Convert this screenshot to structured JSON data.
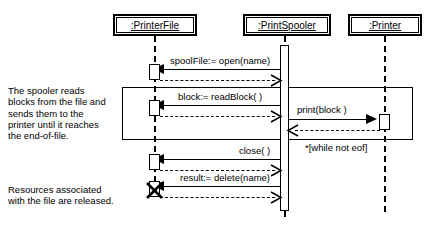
{
  "diagram": {
    "type": "uml-sequence-diagram",
    "objects": [
      {
        "id": "printerfile",
        "label": ":PrinterFile",
        "lifeline_x": 155
      },
      {
        "id": "printspooler",
        "label": ":PrintSpooler",
        "lifeline_x": 285
      },
      {
        "id": "printer",
        "label": ":Printer",
        "lifeline_x": 385
      }
    ],
    "messages": [
      {
        "id": "m1",
        "label": "spoolFile:= open(name)",
        "from": "printspooler",
        "to": "printerfile",
        "kind": "call",
        "direction": "left"
      },
      {
        "id": "r1",
        "label": "",
        "from": "printerfile",
        "to": "printspooler",
        "kind": "return",
        "direction": "right"
      },
      {
        "id": "m2",
        "label": "block:= readBlock( )",
        "from": "printspooler",
        "to": "printerfile",
        "kind": "call",
        "direction": "left"
      },
      {
        "id": "r2",
        "label": "",
        "from": "printerfile",
        "to": "printspooler",
        "kind": "return",
        "direction": "right"
      },
      {
        "id": "m3",
        "label": "print(block )",
        "from": "printspooler",
        "to": "printer",
        "kind": "call",
        "direction": "right"
      },
      {
        "id": "r3",
        "label": "",
        "from": "printer",
        "to": "printspooler",
        "kind": "return",
        "direction": "left"
      },
      {
        "id": "m4",
        "label": "close( )",
        "from": "printspooler",
        "to": "printerfile",
        "kind": "call",
        "direction": "left"
      },
      {
        "id": "r4",
        "label": "",
        "from": "printerfile",
        "to": "printspooler",
        "kind": "return",
        "direction": "right"
      },
      {
        "id": "m5",
        "label": "result:= delete(name)",
        "from": "printspooler",
        "to": "printerfile",
        "kind": "call",
        "direction": "left"
      },
      {
        "id": "r5",
        "label": "",
        "from": "printerfile",
        "to": "printspooler",
        "kind": "return",
        "direction": "right"
      }
    ],
    "loop": {
      "guard": "*[while not eof]",
      "encloses": [
        "m2",
        "r2",
        "m3",
        "r3"
      ]
    },
    "notes": [
      {
        "id": "note-loop",
        "text": "The spooler reads\nblocks from the file and\nsends them to the\nprinter until it reaches\nthe end-of-file."
      },
      {
        "id": "note-destroy",
        "text": "Resources associated\nwith the file are released."
      }
    ],
    "destruction": {
      "object": "printerfile",
      "marker": "X"
    },
    "colors": {
      "stroke": "#000000",
      "background": "#ffffff"
    }
  }
}
